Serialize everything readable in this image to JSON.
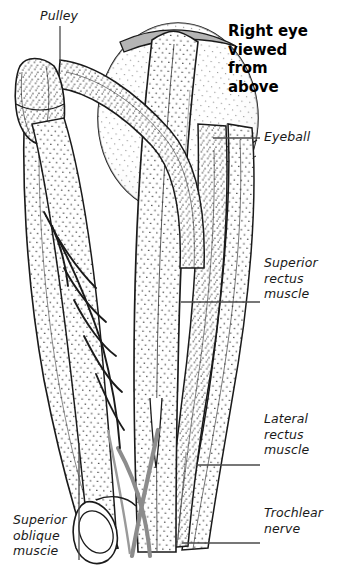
{
  "figure": {
    "width": 350,
    "height": 576,
    "background_color": "#ffffff",
    "ink_color": "#1a1a1a",
    "stipple_color": "#4a4a4a",
    "nerve_color": "#8c8c8c",
    "tendon_band_color": "#b5b5b5"
  },
  "title": {
    "text": "Right eye\nviewed\nfrom\nabove",
    "style": "bold"
  },
  "labels": {
    "pulley": {
      "text": "Pulley",
      "style": "italic",
      "leader": {
        "type": "vertical",
        "x": 60,
        "y1": 26,
        "y2": 63
      }
    },
    "eyeball": {
      "text": "Eyeball",
      "style": "italic",
      "leader": {
        "type": "horizontal",
        "y": 138,
        "x1": 213,
        "x2": 260
      }
    },
    "superior_rectus_muscle": {
      "text": "Superior\nrectus\nmuscle",
      "style": "italic",
      "leader": {
        "type": "horizontal",
        "y": 302,
        "x1": 181,
        "x2": 260
      }
    },
    "lateral_rectus_muscle": {
      "text": "Lateral\nrectus\nmuscle",
      "style": "italic",
      "leader": {
        "type": "horizontal",
        "y": 465,
        "x1": 196,
        "x2": 260
      }
    },
    "trochlear_nerve": {
      "text": "Trochlear\nnerve",
      "style": "italic",
      "leader": {
        "type": "horizontal",
        "y": 543,
        "x1": 182,
        "x2": 260
      }
    },
    "superior_oblique_muscle": {
      "text": "Superior\noblique\nmuscie",
      "style": "italic",
      "leader": {
        "type": "vertical",
        "x": 79,
        "y1": 443,
        "y2": 560
      }
    }
  },
  "structures": [
    {
      "name": "eyeball",
      "kind": "sphere"
    },
    {
      "name": "superior-rectus-muscle",
      "kind": "muscle-band"
    },
    {
      "name": "lateral-rectus-muscle",
      "kind": "muscle-band"
    },
    {
      "name": "medial-rectus-muscle",
      "kind": "muscle-band"
    },
    {
      "name": "superior-oblique-muscle",
      "kind": "muscle-band"
    },
    {
      "name": "superior-oblique-tendon",
      "kind": "tendon"
    },
    {
      "name": "pulley-trochlea",
      "kind": "cartilage-loop"
    },
    {
      "name": "trochlear-nerve",
      "kind": "nerve-strand"
    },
    {
      "name": "trochlear-nerve-branches",
      "kind": "nerve-branches"
    },
    {
      "name": "muscle-cut-end",
      "kind": "cut-cylinder"
    },
    {
      "name": "superior-rectus-tendon-band",
      "kind": "tendon-band"
    }
  ]
}
